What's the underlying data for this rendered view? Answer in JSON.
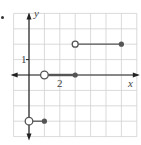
{
  "chart_data": {
    "type": "line",
    "title": "",
    "xlabel": "x",
    "ylabel": "y",
    "xlim": [
      -1,
      7
    ],
    "ylim": [
      -4,
      4
    ],
    "grid": true,
    "x_tick_labels": [
      {
        "value": 2,
        "label": "2"
      }
    ],
    "y_tick_labels": [
      {
        "value": 1,
        "label": "1"
      }
    ],
    "series": [
      {
        "name": "segment-1",
        "x": [
          0,
          1
        ],
        "y": [
          -3,
          -3
        ],
        "left_endpoint": "open",
        "right_endpoint": "closed"
      },
      {
        "name": "segment-2",
        "x": [
          1,
          3
        ],
        "y": [
          0,
          0
        ],
        "left_endpoint": "open",
        "right_endpoint": "closed"
      },
      {
        "name": "segment-3",
        "x": [
          3,
          6
        ],
        "y": [
          2,
          2
        ],
        "left_endpoint": "open",
        "right_endpoint": "closed"
      }
    ]
  },
  "labels": {
    "x_axis": "x",
    "y_axis": "y",
    "tick_x_2": "2",
    "tick_y_1": "1"
  },
  "colors": {
    "grid": "#d0d0d0",
    "axis": "#222222",
    "segment": "#555555"
  }
}
